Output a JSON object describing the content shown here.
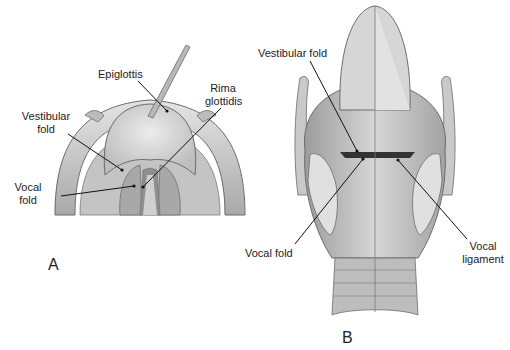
{
  "figure": {
    "panels": [
      {
        "id": "A",
        "label": "A",
        "description": "Superior view of larynx with probe on epiglottis",
        "annotations": {
          "epiglottis": "Epiglottis",
          "rima_glottidis_line1": "Rima",
          "rima_glottidis_line2": "glottidis",
          "vestibular_fold_line1": "Vestibular",
          "vestibular_fold_line2": "fold",
          "vocal_fold_line1": "Vocal",
          "vocal_fold_line2": "fold"
        }
      },
      {
        "id": "B",
        "label": "B",
        "description": "Posterior coronal section of larynx",
        "annotations": {
          "vestibular_fold": "Vestibular fold",
          "vocal_fold": "Vocal fold",
          "vocal_ligament_line1": "Vocal",
          "vocal_ligament_line2": "ligament"
        }
      }
    ],
    "colors": {
      "tissue_light": "#d9d9d9",
      "tissue_mid": "#b5b5b5",
      "tissue_dark": "#8a8a8a",
      "outline": "#6b6b6b",
      "leader": "#111111"
    }
  }
}
